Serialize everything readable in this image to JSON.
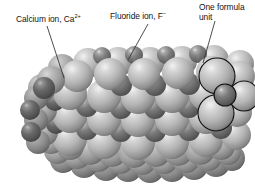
{
  "figure": {
    "background_color": "#ffffff"
  },
  "labels": {
    "calcium": {
      "text_before": "Calcium ion, Ca",
      "charge": "2+",
      "full": "Calcium ion, Ca2+"
    },
    "fluoride": {
      "text_before": "Fluoride ion, F",
      "charge": "−",
      "full": "Fluoride ion, F−"
    },
    "formula_unit": {
      "line1": "One formula",
      "line2": "unit",
      "full": "One formula unit"
    }
  },
  "ion_colors": {
    "calcium_sphere": "#6e6e6e",
    "fluoride_sphere": "#b6b6b6",
    "outline": "#111111",
    "leader_line": "#3a3a3a"
  },
  "structure": {
    "calcium_ion_label": "Calcium ion",
    "fluoride_ion_label": "Fluoride ion",
    "calcium_radius_px": 11,
    "fluoride_radius_px": 17,
    "leader_lines": 3
  }
}
